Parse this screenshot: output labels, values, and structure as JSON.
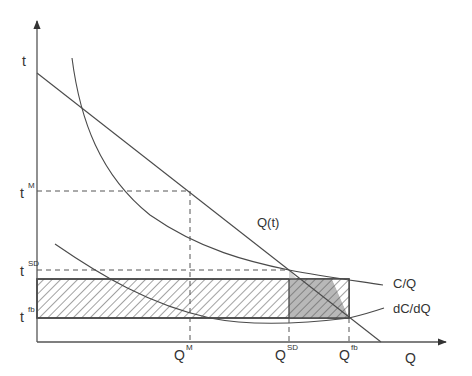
{
  "diagram": {
    "type": "economics-cost-curves",
    "axes": {
      "y_label": "t",
      "x_label": "Q"
    },
    "y_ticks": [
      {
        "base": "t",
        "sup": "M"
      },
      {
        "base": "t",
        "sup": "SD"
      },
      {
        "base": "t",
        "sup": "fb"
      }
    ],
    "x_ticks": [
      {
        "base": "Q",
        "sup": "M"
      },
      {
        "base": "Q",
        "sup": "SD"
      },
      {
        "base": "Q",
        "sup": "fb"
      }
    ],
    "curves": [
      {
        "name": "demand",
        "label": "Q(t)"
      },
      {
        "name": "average-cost",
        "label": "C/Q"
      },
      {
        "name": "marginal-cost",
        "label": "dC/dQ"
      }
    ],
    "regions": [
      {
        "name": "hatched-rectangle",
        "description": "between t^fb and t^SD-level, from Q=0 to Q^fb"
      },
      {
        "name": "shaded-triangle",
        "description": "between Q^SD and Q^fb under Q(t)"
      }
    ],
    "colors": {
      "line": "#4a4a4a",
      "shade": "#b8b8b8",
      "shade_light": "#d6d6d6",
      "text": "#333333"
    }
  }
}
